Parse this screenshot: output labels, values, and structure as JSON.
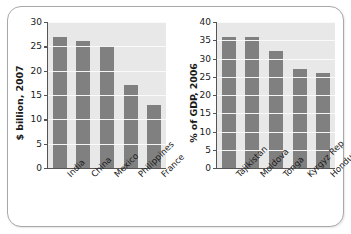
{
  "chart_data": [
    {
      "type": "bar",
      "panel": "left",
      "title": "",
      "xlabel": "",
      "ylabel": "$ billion, 2007",
      "ylim": [
        0,
        30
      ],
      "yticks": [
        0,
        5,
        10,
        15,
        20,
        25,
        30
      ],
      "ytick_labels": [
        "0",
        "5",
        "10",
        "15",
        "20",
        "25",
        "30"
      ],
      "grid": true,
      "legend": "none",
      "categories": [
        "India",
        "China",
        "Mexico",
        "Philippines",
        "France"
      ],
      "values": [
        27,
        26,
        25,
        17,
        13
      ],
      "bar_color": "#808080",
      "plot_bg": "#e8e8e8"
    },
    {
      "type": "bar",
      "panel": "right",
      "title": "",
      "xlabel": "",
      "ylabel": "% of GDP, 2006",
      "ylim": [
        0,
        40
      ],
      "yticks": [
        0,
        5,
        10,
        15,
        20,
        25,
        30,
        35,
        40
      ],
      "ytick_labels": [
        "0",
        "5",
        "10",
        "15",
        "20",
        "25",
        "30",
        "35",
        "40"
      ],
      "grid": true,
      "legend": "none",
      "categories": [
        "Tajikistan",
        "Moldova",
        "Tonga",
        "Kyrgyz Rep",
        "Honduras"
      ],
      "values": [
        36,
        36,
        32,
        27,
        26
      ],
      "bar_color": "#808080",
      "plot_bg": "#e8e8e8"
    }
  ]
}
